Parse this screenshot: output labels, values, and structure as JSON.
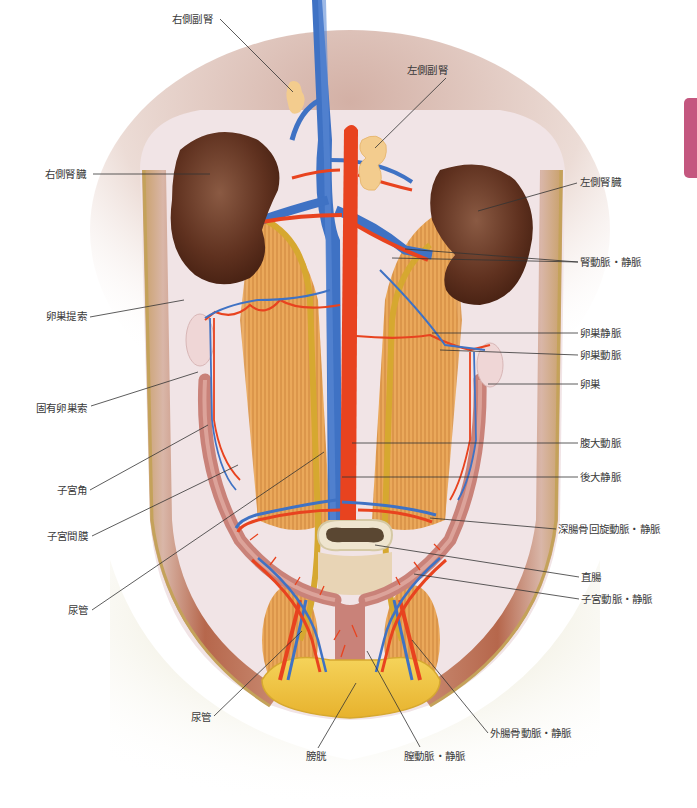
{
  "diagram": {
    "colors": {
      "artery": "#e8431f",
      "vein": "#3f72c4",
      "kidney": "#6b3a24",
      "adrenal": "#f3cc8e",
      "ureter": "#d9aa33",
      "muscle": "#e9a857",
      "uterus": "#c98279",
      "bladder": "#f3c33c",
      "body_wall": "#c88a6a",
      "pelvis_bg": "#d8d2a4",
      "side_tab": "#c4577f",
      "leader_line": "#333333"
    }
  },
  "side_tab": {
    "color": "#c4577f"
  },
  "labels": [
    {
      "id": "right-adrenal",
      "text": "右側副腎",
      "x": 172,
      "y": 13,
      "align": "left",
      "line": [
        220,
        19,
        293,
        92
      ]
    },
    {
      "id": "left-adrenal",
      "text": "左側副腎",
      "x": 407,
      "y": 64,
      "align": "left",
      "line": [
        446,
        78,
        375,
        148
      ]
    },
    {
      "id": "right-kidney",
      "text": "右側腎臓",
      "x": 45,
      "y": 168,
      "align": "left",
      "line": [
        93,
        174,
        210,
        174
      ]
    },
    {
      "id": "left-kidney",
      "text": "左側腎臓",
      "x": 580,
      "y": 176,
      "align": "left",
      "line": [
        577,
        183,
        478,
        211
      ]
    },
    {
      "id": "renal-artery-vein",
      "text": "腎動脈・静脈",
      "x": 580,
      "y": 256,
      "align": "left",
      "line": [
        578,
        262,
        405,
        249
      ],
      "line2": [
        578,
        262,
        392,
        258
      ]
    },
    {
      "id": "ovarian-suspensory-ligament",
      "text": "卵巣提索",
      "x": 46,
      "y": 310,
      "align": "left",
      "line": [
        90,
        317,
        184,
        300
      ]
    },
    {
      "id": "ovarian-vein",
      "text": "卵巣静脈",
      "x": 580,
      "y": 327,
      "align": "left",
      "line": [
        578,
        333,
        432,
        333
      ]
    },
    {
      "id": "ovarian-artery",
      "text": "卵巣動脈",
      "x": 580,
      "y": 349,
      "align": "left",
      "line": [
        578,
        355,
        440,
        350
      ]
    },
    {
      "id": "ovary",
      "text": "卵巣",
      "x": 580,
      "y": 378,
      "align": "left",
      "line": [
        578,
        384,
        488,
        384
      ]
    },
    {
      "id": "proper-ovarian-ligament",
      "text": "固有卵巣索",
      "x": 36,
      "y": 402,
      "align": "left",
      "line": [
        91,
        406,
        198,
        372
      ]
    },
    {
      "id": "abdominal-aorta",
      "text": "腹大動脈",
      "x": 580,
      "y": 437,
      "align": "left",
      "line": [
        578,
        443,
        352,
        443
      ]
    },
    {
      "id": "caudal-vena-cava",
      "text": "後大静脈",
      "x": 580,
      "y": 471,
      "align": "left",
      "line": [
        578,
        477,
        342,
        477
      ]
    },
    {
      "id": "uterine-horn",
      "text": "子宮角",
      "x": 57,
      "y": 484,
      "align": "left",
      "line": [
        90,
        490,
        208,
        425
      ]
    },
    {
      "id": "deep-circumflex-iliac-artery-vein",
      "text": "深腸骨回旋動脈・静脈",
      "x": 558,
      "y": 523,
      "align": "left",
      "line": [
        556,
        529,
        430,
        518
      ]
    },
    {
      "id": "mesometrium",
      "text": "子宮間膜",
      "x": 47,
      "y": 530,
      "align": "left",
      "line": [
        92,
        536,
        238,
        465
      ]
    },
    {
      "id": "rectum",
      "text": "直腸",
      "x": 581,
      "y": 571,
      "align": "left",
      "line": [
        579,
        577,
        375,
        545
      ]
    },
    {
      "id": "ureter-upper",
      "text": "尿管",
      "x": 68,
      "y": 604,
      "align": "left",
      "line": [
        92,
        610,
        324,
        452
      ]
    },
    {
      "id": "uterine-artery-vein",
      "text": "子宮動脈・静脈",
      "x": 581,
      "y": 593,
      "align": "left",
      "line": [
        579,
        599,
        414,
        574
      ]
    },
    {
      "id": "ureter-lower",
      "text": "尿管",
      "x": 191,
      "y": 711,
      "align": "left",
      "line": [
        214,
        716,
        302,
        631
      ]
    },
    {
      "id": "external-iliac-artery-vein",
      "text": "外腸骨動脈・静脈",
      "x": 490,
      "y": 727,
      "align": "left",
      "line": [
        488,
        733,
        412,
        640
      ]
    },
    {
      "id": "urinary-bladder",
      "text": "膀胱",
      "x": 306,
      "y": 750,
      "align": "left",
      "line": [
        318,
        748,
        356,
        683
      ]
    },
    {
      "id": "vaginal-artery-vein",
      "text": "膣動脈・静脈",
      "x": 404,
      "y": 750,
      "align": "left",
      "line": [
        420,
        747,
        367,
        651
      ]
    }
  ]
}
